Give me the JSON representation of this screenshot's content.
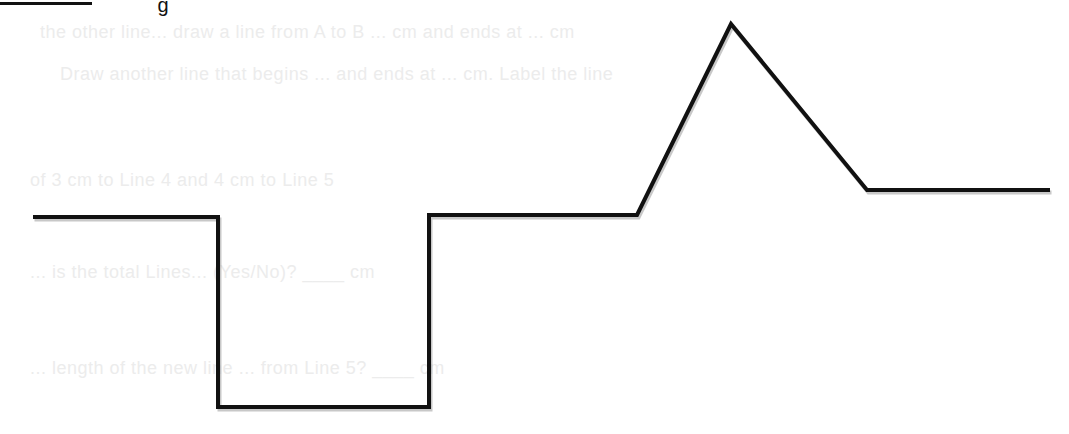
{
  "header": {
    "fragment_text": "g"
  },
  "ghost_text": [
    {
      "text": "the other line... draw a line from A to B ... cm and ends at ... cm",
      "x": 40,
      "y": 22
    },
    {
      "text": "Draw another line that begins ... and ends at ... cm. Label the line",
      "x": 60,
      "y": 64
    },
    {
      "text": "of 3 cm to Line 4 and 4 cm to Line 5",
      "x": 30,
      "y": 170
    },
    {
      "text": "... is the total Lines... (Yes/No)? ____ cm",
      "x": 30,
      "y": 262
    },
    {
      "text": "... length of the new line ... from Line 5? ____ cm",
      "x": 30,
      "y": 358
    }
  ],
  "diagram": {
    "stroke_color": "#111111",
    "stroke_width": 4,
    "polyline_points": [
      [
        33,
        217
      ],
      [
        218,
        217
      ],
      [
        218,
        407
      ],
      [
        429,
        407
      ],
      [
        429,
        215
      ],
      [
        637,
        215
      ],
      [
        731,
        24
      ],
      [
        867,
        190
      ],
      [
        1050,
        190
      ]
    ],
    "segments": [
      {
        "name": "segment-left-flat",
        "from": [
          33,
          217
        ],
        "to": [
          218,
          217
        ]
      },
      {
        "name": "segment-drop",
        "from": [
          218,
          217
        ],
        "to": [
          218,
          407
        ]
      },
      {
        "name": "segment-bottom-flat",
        "from": [
          218,
          407
        ],
        "to": [
          429,
          407
        ]
      },
      {
        "name": "segment-rise",
        "from": [
          429,
          407
        ],
        "to": [
          429,
          215
        ]
      },
      {
        "name": "segment-middle-flat",
        "from": [
          429,
          215
        ],
        "to": [
          637,
          215
        ]
      },
      {
        "name": "segment-peak-up",
        "from": [
          637,
          215
        ],
        "to": [
          731,
          24
        ]
      },
      {
        "name": "segment-peak-down",
        "from": [
          731,
          24
        ],
        "to": [
          867,
          190
        ]
      },
      {
        "name": "segment-right-flat",
        "from": [
          867,
          190
        ],
        "to": [
          1050,
          190
        ]
      }
    ]
  }
}
